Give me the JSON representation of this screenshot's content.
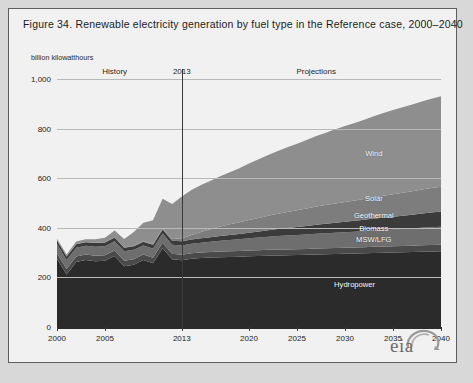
{
  "figure": {
    "title": "Figure 34. Renewable electricity generation by fuel type in the Reference case, 2000–2040",
    "units": "billion kilowatthours",
    "logo_text": "eia",
    "logo_icon": "eia-swoosh-icon"
  },
  "annotations": {
    "history": "History",
    "split_year": "2013",
    "projections": "Projections"
  },
  "chart_data": {
    "type": "area",
    "title": "Figure 34. Renewable electricity generation by fuel type in the Reference case, 2000–2040",
    "subtitle": "billion kilowatthours",
    "xlabel": "",
    "ylabel": "billion kilowatthours",
    "stacked": true,
    "grid": true,
    "legend_position": "inline-right",
    "xlim": [
      2000,
      2040
    ],
    "ylim": [
      0,
      1000
    ],
    "yticks": [
      0,
      200,
      400,
      600,
      800,
      1000
    ],
    "ytick_labels": [
      "0",
      "200",
      "400",
      "600",
      "800",
      "1,000"
    ],
    "xticks": [
      2000,
      2005,
      2013,
      2020,
      2025,
      2030,
      2035,
      2040
    ],
    "xtick_labels": [
      "2000",
      "2005",
      "2013",
      "2020",
      "2025",
      "2030",
      "2035",
      "2040"
    ],
    "history_end": 2013,
    "annotations": [
      {
        "text": "History",
        "x": 2006
      },
      {
        "text": "2013",
        "x": 2013
      },
      {
        "text": "Projections",
        "x": 2027
      }
    ],
    "x": [
      2000,
      2001,
      2002,
      2003,
      2004,
      2005,
      2006,
      2007,
      2008,
      2009,
      2010,
      2011,
      2012,
      2013,
      2014,
      2015,
      2016,
      2017,
      2018,
      2019,
      2020,
      2021,
      2022,
      2023,
      2024,
      2025,
      2026,
      2027,
      2028,
      2029,
      2030,
      2031,
      2032,
      2033,
      2034,
      2035,
      2036,
      2037,
      2038,
      2039,
      2040
    ],
    "series": [
      {
        "name": "Hydropower",
        "color": "#2b2b2b",
        "values": [
          275,
          212,
          262,
          270,
          265,
          267,
          286,
          245,
          251,
          270,
          257,
          318,
          273,
          269,
          275,
          278,
          280,
          281,
          282,
          283,
          285,
          286,
          287,
          288,
          289,
          290,
          291,
          292,
          293,
          294,
          295,
          296,
          297,
          298,
          299,
          300,
          301,
          302,
          303,
          304,
          305
        ]
      },
      {
        "name": "MSW/LFG",
        "color": "#4a4a4a",
        "values": [
          22,
          22,
          22,
          22,
          22,
          22,
          22,
          22,
          22,
          22,
          22,
          22,
          22,
          22,
          22,
          22,
          22,
          23,
          23,
          23,
          23,
          23,
          24,
          24,
          24,
          24,
          24,
          25,
          25,
          25,
          25,
          25,
          25,
          26,
          26,
          26,
          26,
          26,
          27,
          27,
          27
        ]
      },
      {
        "name": "Biomass",
        "color": "#6e6e6e",
        "values": [
          38,
          36,
          36,
          36,
          37,
          37,
          38,
          38,
          38,
          37,
          37,
          37,
          37,
          38,
          39,
          40,
          42,
          44,
          46,
          48,
          50,
          52,
          53,
          55,
          56,
          57,
          58,
          59,
          60,
          61,
          62,
          63,
          64,
          65,
          66,
          67,
          68,
          69,
          70,
          71,
          72
        ]
      },
      {
        "name": "Geothermal",
        "color": "#3b3b3b",
        "values": [
          14,
          14,
          14,
          14,
          15,
          15,
          15,
          15,
          15,
          15,
          16,
          16,
          16,
          17,
          17,
          18,
          18,
          19,
          20,
          21,
          22,
          24,
          26,
          28,
          30,
          32,
          34,
          36,
          38,
          40,
          42,
          44,
          46,
          48,
          50,
          52,
          54,
          56,
          58,
          60,
          62
        ]
      },
      {
        "name": "Solar",
        "color": "#7d7d7d",
        "values": [
          1,
          1,
          1,
          1,
          1,
          1,
          1,
          1,
          2,
          2,
          3,
          4,
          7,
          12,
          18,
          25,
          32,
          38,
          43,
          47,
          51,
          55,
          59,
          62,
          65,
          68,
          71,
          74,
          76,
          78,
          80,
          82,
          84,
          86,
          88,
          90,
          92,
          94,
          96,
          98,
          100
        ]
      },
      {
        "name": "Wind",
        "color": "#8e8e8e",
        "values": [
          6,
          7,
          10,
          11,
          14,
          18,
          27,
          34,
          55,
          74,
          95,
          120,
          141,
          168,
          181,
          190,
          196,
          203,
          210,
          218,
          228,
          236,
          245,
          253,
          261,
          268,
          276,
          284,
          291,
          299,
          306,
          313,
          320,
          327,
          334,
          340,
          345,
          350,
          355,
          360,
          364
        ]
      }
    ],
    "series_labels": [
      {
        "name": "Wind",
        "x": 2033,
        "y": 700
      },
      {
        "name": "Solar",
        "x": 2033,
        "y": 520
      },
      {
        "name": "Geothermal",
        "x": 2033,
        "y": 450
      },
      {
        "name": "Biomass",
        "x": 2033,
        "y": 398
      },
      {
        "name": "MSW/LFG",
        "x": 2033,
        "y": 355
      },
      {
        "name": "Hydropower",
        "x": 2031,
        "y": 175
      }
    ]
  }
}
